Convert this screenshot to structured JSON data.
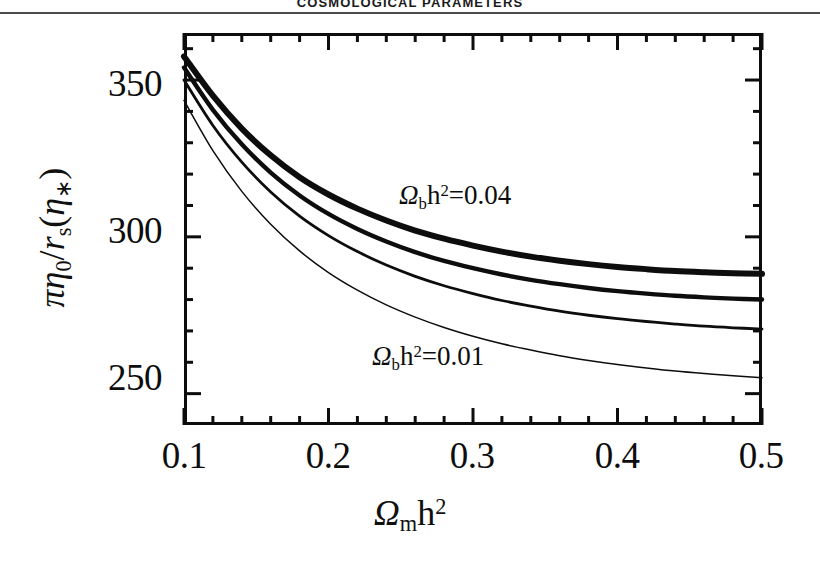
{
  "page": {
    "running_header": "COSMOLOGICAL PARAMETERS"
  },
  "chart_data": {
    "type": "line",
    "title": "",
    "xlabel_parts": {
      "symbol": "Ω",
      "sub": "m",
      "tail": "h",
      "sup": "2"
    },
    "ylabel_parts": {
      "pi": "π",
      "eta": "η",
      "eta_sub": "0",
      "slash": "/",
      "r": "r",
      "r_sub": "s",
      "open": "(",
      "eta2": "η",
      "eta2_sub": "∗",
      "close": ")"
    },
    "xlabel": "Ω_m h²",
    "ylabel": "πη₀/r_s(η∗)",
    "xlim": [
      0.1,
      0.5
    ],
    "ylim": [
      240,
      365
    ],
    "xticks": [
      0.1,
      0.2,
      0.3,
      0.4,
      0.5
    ],
    "xtick_labels": [
      "0.1",
      "0.2",
      "0.3",
      "0.4",
      "0.5"
    ],
    "yticks": [
      250,
      300,
      350
    ],
    "ytick_labels": [
      "250",
      "300",
      "350"
    ],
    "x_minor_per_major": 5,
    "y_minor_per_major": 5,
    "grid": false,
    "legend": "none",
    "annotations": [
      {
        "name": "upper-curve-label",
        "text": "Ω_b h²=0.04",
        "symbol": "Ω",
        "sub": "b",
        "tail": "h",
        "sup": "2",
        "eq": "=0.04",
        "x": 0.285,
        "y": 312
      },
      {
        "name": "lower-curve-label",
        "text": "Ω_b h²=0.01",
        "symbol": "Ω",
        "sub": "b",
        "tail": "h",
        "sup": "2",
        "eq": "=0.01",
        "x": 0.268,
        "y": 258
      }
    ],
    "x": [
      0.1,
      0.12,
      0.14,
      0.16,
      0.18,
      0.2,
      0.22,
      0.24,
      0.26,
      0.28,
      0.3,
      0.32,
      0.34,
      0.36,
      0.38,
      0.4,
      0.42,
      0.44,
      0.46,
      0.48,
      0.5
    ],
    "series": [
      {
        "name": "Ω_b h²=0.04",
        "label": "0.04",
        "line_width": 6,
        "color": "#0d0d0d",
        "values": [
          357.5,
          345.0,
          334.5,
          326.0,
          319.0,
          313.5,
          309.0,
          305.2,
          302.0,
          299.4,
          297.2,
          295.3,
          293.7,
          292.4,
          291.3,
          290.4,
          289.7,
          289.1,
          288.7,
          288.4,
          288.2
        ]
      },
      {
        "name": "Ω_b h²=0.03",
        "label": "0.03",
        "line_width": 4.4,
        "color": "#0d0d0d",
        "values": [
          354.0,
          340.5,
          329.5,
          320.5,
          313.2,
          307.3,
          302.5,
          298.5,
          295.1,
          292.3,
          290.0,
          288.0,
          286.3,
          284.9,
          283.7,
          282.7,
          281.9,
          281.2,
          280.7,
          280.3,
          280.0
        ]
      },
      {
        "name": "Ω_b h²=0.02",
        "label": "0.02",
        "line_width": 2.8,
        "color": "#0d0d0d",
        "values": [
          350.0,
          335.5,
          323.8,
          314.3,
          306.6,
          300.4,
          295.3,
          291.0,
          287.4,
          284.4,
          281.9,
          279.7,
          277.9,
          276.3,
          275.0,
          273.9,
          273.0,
          272.2,
          271.5,
          271.0,
          270.6
        ]
      },
      {
        "name": "Ω_b h²=0.01",
        "label": "0.01",
        "line_width": 1.5,
        "color": "#0d0d0d",
        "values": [
          343.5,
          327.5,
          314.5,
          304.0,
          295.5,
          288.6,
          283.0,
          278.3,
          274.4,
          271.1,
          268.3,
          265.9,
          263.9,
          262.1,
          260.6,
          259.3,
          258.2,
          257.2,
          256.4,
          255.7,
          255.1
        ]
      }
    ]
  }
}
